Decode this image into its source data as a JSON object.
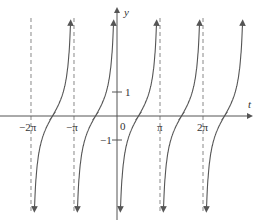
{
  "chart_data": {
    "type": "line",
    "function": "y = -cot t",
    "title": "",
    "xlabel": "t",
    "ylabel": "y",
    "x_ticks": [
      {
        "value": -6.2832,
        "label": "-2π"
      },
      {
        "value": -3.1416,
        "label": "-π"
      },
      {
        "value": 0,
        "label": "0"
      },
      {
        "value": 3.1416,
        "label": "π"
      },
      {
        "value": 6.2832,
        "label": "2π"
      }
    ],
    "y_ticks": [
      {
        "value": 1,
        "label": "1"
      },
      {
        "value": -1,
        "label": "-1"
      }
    ],
    "asymptotes_x": [
      -6.2832,
      -3.1416,
      0,
      3.1416,
      6.2832
    ],
    "zeros_x": [
      -4.7124,
      -1.5708,
      1.5708,
      4.7124,
      7.854
    ],
    "xlim": [
      -8.5,
      9.2
    ],
    "ylim": [
      -6.5,
      7.5
    ],
    "grid": false,
    "legend": null
  },
  "labels": {
    "x_axis": "t",
    "y_axis": "y",
    "origin": "0",
    "tick_neg2pi": "−2π",
    "tick_negpi": "−π",
    "tick_pi": "π",
    "tick_2pi": "2π",
    "tick_y1": "1",
    "tick_yneg1": "−1"
  },
  "colors": {
    "curve": "#555555",
    "axis": "#555555",
    "asymptote": "#888888",
    "text": "#333333"
  }
}
